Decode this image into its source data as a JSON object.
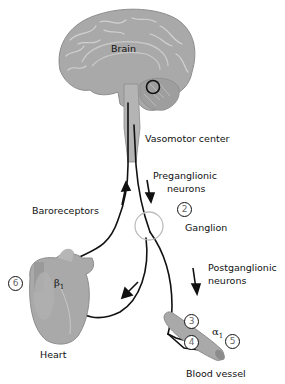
{
  "labels": {
    "brain": "Brain",
    "vasomotor_center": "Vasomotor center",
    "preganglionic_line1": "Preganglionic",
    "preganglionic_line2": "neurons",
    "ganglion": "Ganglion",
    "postganglionic_line1": "Postganglionic",
    "postganglionic_line2": "neurons",
    "baroreceptors": "Baroreceptors",
    "heart": "Heart",
    "blood_vessel": "Blood vessel"
  },
  "receptors": {
    "beta": "β",
    "beta_sub": "1",
    "alpha": "α",
    "alpha_sub": "1"
  },
  "markers": {
    "m2": "2",
    "m3": "3",
    "m4": "4",
    "m5": "5",
    "m6": "6"
  },
  "colors": {
    "tissue": "#a9a9a9",
    "tissue_dark": "#8c8c8c",
    "line": "#111111",
    "ganglion_ring": "#bdbdbd"
  }
}
